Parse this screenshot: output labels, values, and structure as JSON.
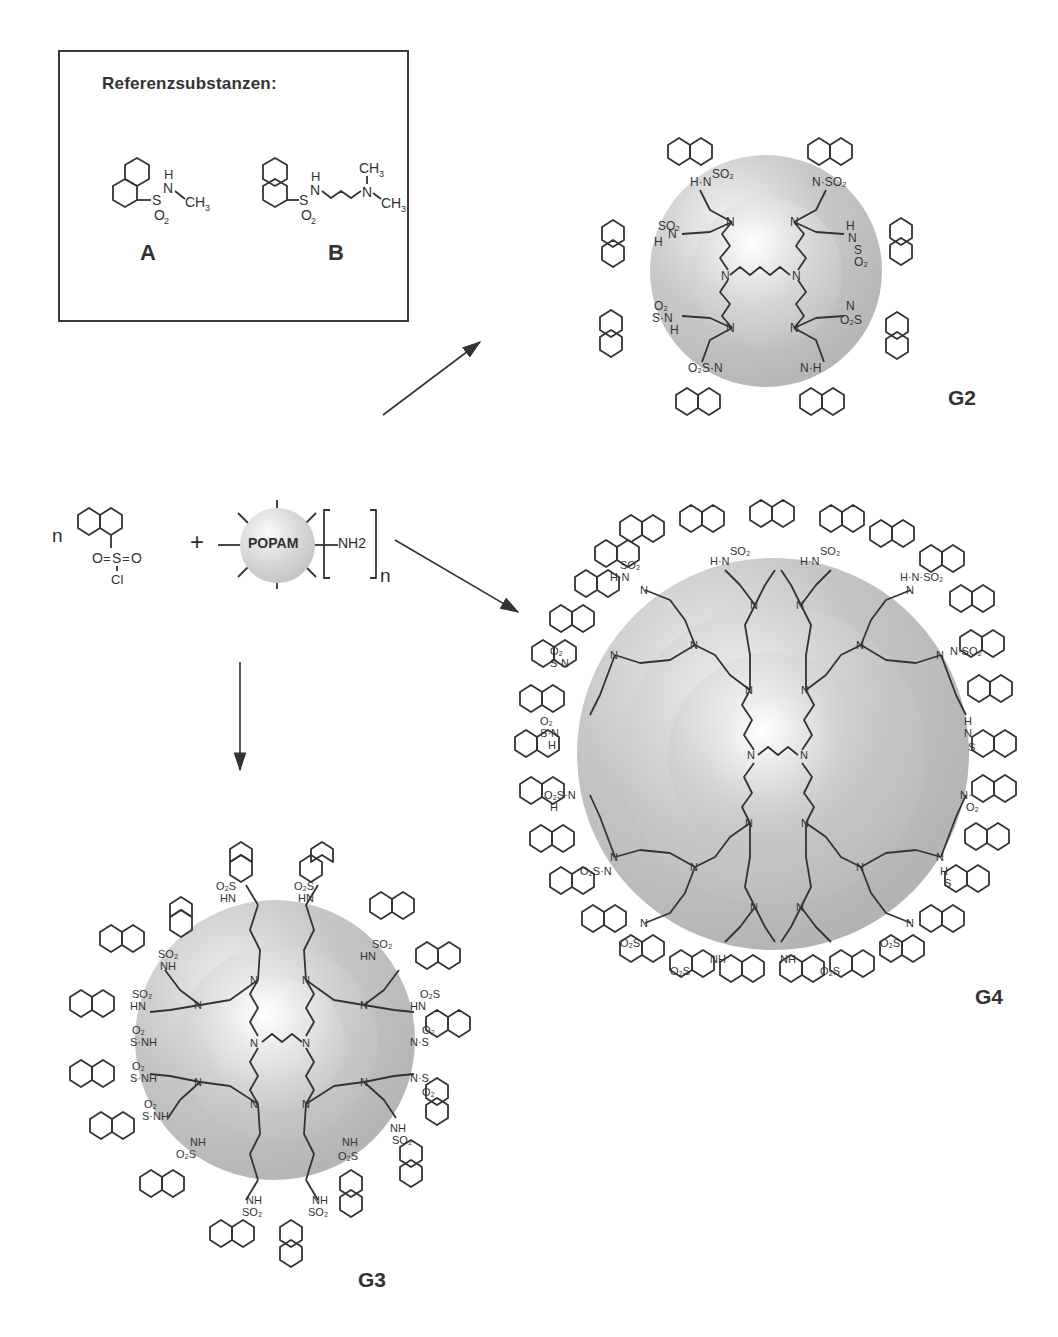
{
  "figure": {
    "reference_box": {
      "title": "Referenzsubstanzen:",
      "compounds": [
        {
          "label": "A",
          "description": "N-methyl-1-naphthalenesulfonamide",
          "groups": {
            "nh": "H",
            "n": "N",
            "s": "S",
            "o2": "O2",
            "methyl": "CH3"
          }
        },
        {
          "label": "B",
          "description": "N-(3-dimethylaminopropyl)-1-naphthalenesulfonamide",
          "groups": {
            "nh": "H",
            "n": "N",
            "s": "S",
            "o2": "O2",
            "methyl_top": "CH3",
            "methyl_right": "CH3",
            "amine_n": "N"
          }
        }
      ]
    },
    "reaction": {
      "reagent_coefficient": "n",
      "sulfonyl_chloride": {
        "o_left": "O",
        "s": "S",
        "o_right": "O",
        "cl": "Cl"
      },
      "plus": "+",
      "core_label": "POPAM",
      "end_group": "NH2",
      "repeat_subscript": "n"
    },
    "products": [
      {
        "label": "G2",
        "generation": 2,
        "shells": 2,
        "naphthyl_groups": 8,
        "substitution": "1-naphthyl"
      },
      {
        "label": "G3",
        "generation": 3,
        "shells": 3,
        "naphthyl_groups": 16,
        "substitution": "2-naphthyl"
      },
      {
        "label": "G4",
        "generation": 4,
        "shells": 4,
        "naphthyl_groups": 32,
        "substitution": "1-naphthyl"
      }
    ],
    "labels": {
      "N": "N",
      "H": "H",
      "SO2": "SO2",
      "O2S": "O2S",
      "NH": "NH",
      "HN": "HN"
    },
    "colors": {
      "line": "#333333",
      "sphere_light": "#f2f2f2",
      "sphere_mid": "#c8c8c8",
      "sphere_dark": "#a9a9a9",
      "background": "#ffffff"
    }
  }
}
